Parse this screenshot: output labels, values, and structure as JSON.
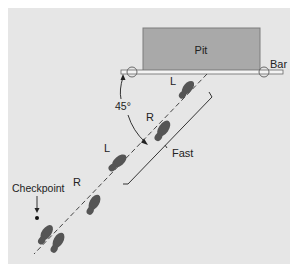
{
  "figure": {
    "type": "diagram",
    "colors": {
      "background": "#e6e6e6",
      "pit_fill": "#a9a9a9",
      "pit_border": "#7c7c7c",
      "bar_fill": "#f4f4f4",
      "bar_border": "#6a6a6a",
      "footprint": "#555555",
      "line": "#444444",
      "text": "#222222"
    },
    "labels": {
      "pit": "Pit",
      "bar": "Bar",
      "angle": "45°",
      "fast": "Fast",
      "checkpoint": "Checkpoint",
      "footprint_L_top": "L",
      "footprint_R_top": "R",
      "footprint_L_mid": "L",
      "footprint_R_bottom": "R"
    },
    "elements": {
      "pit": {
        "x": 143,
        "y": 28,
        "width": 117,
        "height": 43
      },
      "bar": {
        "x1": 121,
        "x2": 283,
        "y": 72
      },
      "bar_supports": [
        {
          "cx": 132,
          "cy": 73
        },
        {
          "cx": 264,
          "cy": 73
        }
      ],
      "approach_line": {
        "x1": 207,
        "y1": 74,
        "x2": 34,
        "y2": 254,
        "style": "dashed"
      },
      "angle_degrees": 45,
      "checkpoint_point": {
        "cx": 37,
        "cy": 219
      }
    }
  }
}
